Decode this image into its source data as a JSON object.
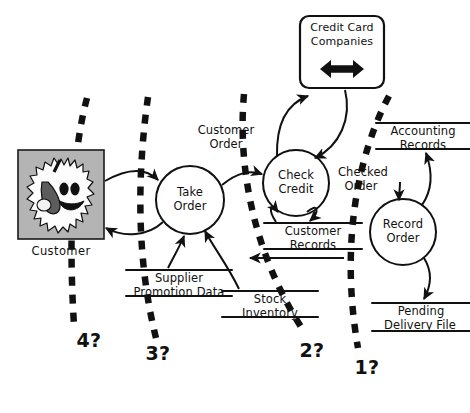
{
  "diagram": {
    "type": "data-flow-diagram",
    "background_color": "#ffffff",
    "ink_color": "#111111",
    "external_fill": "#b4b4b4"
  },
  "external_entities": [
    {
      "id": "customer",
      "label": "Customer",
      "shape": "image-box",
      "icon": "shaggy-monster-character",
      "x": 18,
      "y": 150,
      "w": 86,
      "h": 89
    },
    {
      "id": "credit-card-companies",
      "label_line1": "Credit Card",
      "label_line2": "Companies",
      "label": "Credit Card Companies",
      "shape": "rounded-rect",
      "icon": "double-headed-arrow",
      "x": 300,
      "y": 16,
      "w": 84,
      "h": 72
    }
  ],
  "processes": [
    {
      "id": "take-order",
      "line1": "Take",
      "line2": "Order",
      "label": "Take Order",
      "cx": 190,
      "cy": 200,
      "r": 34
    },
    {
      "id": "check-credit",
      "line1": "Check",
      "line2": "Credit",
      "label": "Check Credit",
      "cx": 296,
      "cy": 183,
      "r": 33
    },
    {
      "id": "record-order",
      "line1": "Record",
      "line2": "Order",
      "label": "Record Order",
      "cx": 403,
      "cy": 232,
      "r": 33
    }
  ],
  "data_stores": [
    {
      "id": "supplier-promotion-data",
      "line1": "Supplier",
      "line2": "Promotion Data",
      "label": "Supplier Promotion Data",
      "x": 126,
      "y": 268,
      "w": 106
    },
    {
      "id": "stock-inventory",
      "line1": "Stock",
      "line2": "Inventory",
      "label": "Stock Inventory",
      "x": 222,
      "y": 289,
      "w": 96
    },
    {
      "id": "customer-records",
      "line1": "Customer",
      "line2": "Records",
      "label": "Customer Records",
      "x": 264,
      "y": 221,
      "w": 98
    },
    {
      "id": "accounting-records",
      "line1": "Accounting",
      "line2": "Records",
      "label": "Accounting Records",
      "x": 376,
      "y": 121,
      "w": 96
    },
    {
      "id": "pending-delivery-file",
      "line1": "Pending",
      "line2": "Delivery File",
      "label": "Pending Delivery File",
      "x": 372,
      "y": 301,
      "w": 98
    }
  ],
  "flow_labels": [
    {
      "id": "customer-order",
      "line1": "Customer",
      "line2": "Order",
      "label": "Customer Order",
      "x": 226,
      "y": 128
    },
    {
      "id": "checked-order",
      "line1": "Checked",
      "line2": "Order",
      "label": "Checked Order",
      "x": 360,
      "y": 170
    }
  ],
  "partition_markers": [
    {
      "id": "partition-1",
      "label": "1?",
      "x": 364,
      "y": 363
    },
    {
      "id": "partition-2",
      "label": "2?",
      "x": 310,
      "y": 350
    },
    {
      "id": "partition-3",
      "label": "3?",
      "x": 155,
      "y": 353
    },
    {
      "id": "partition-4",
      "label": "4?",
      "x": 86,
      "y": 340
    }
  ],
  "icons": {
    "double_headed_arrow": "double-headed-arrow",
    "customer_character": "shaggy-monster-character"
  }
}
